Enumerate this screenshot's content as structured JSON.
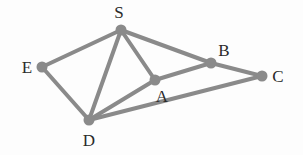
{
  "diagram": {
    "type": "graph",
    "colors": {
      "edge": "#8a8a8a",
      "node": "#8a8a8a",
      "label": "#2a2a2a",
      "background": "#fdfdfd"
    },
    "nodes": [
      {
        "id": "S",
        "label": "S",
        "x": 121,
        "y": 30,
        "lx": 119,
        "ly": 18
      },
      {
        "id": "E",
        "label": "E",
        "x": 42,
        "y": 67,
        "lx": 27,
        "ly": 73
      },
      {
        "id": "A",
        "label": "A",
        "x": 155,
        "y": 80,
        "lx": 162,
        "ly": 102
      },
      {
        "id": "B",
        "label": "B",
        "x": 211,
        "y": 63,
        "lx": 224,
        "ly": 56
      },
      {
        "id": "C",
        "label": "C",
        "x": 262,
        "y": 76,
        "lx": 278,
        "ly": 82
      },
      {
        "id": "D",
        "label": "D",
        "x": 89,
        "y": 120,
        "lx": 89,
        "ly": 146
      }
    ],
    "edges": [
      [
        "S",
        "E"
      ],
      [
        "S",
        "D"
      ],
      [
        "S",
        "A"
      ],
      [
        "S",
        "B"
      ],
      [
        "B",
        "C"
      ],
      [
        "E",
        "D"
      ],
      [
        "D",
        "A"
      ],
      [
        "A",
        "B"
      ],
      [
        "D",
        "C"
      ]
    ]
  }
}
